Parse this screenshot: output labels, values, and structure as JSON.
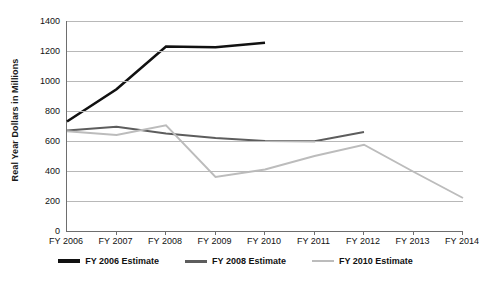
{
  "chart_data": {
    "type": "line",
    "title": "",
    "xlabel": "",
    "ylabel": "Real Year Dollars in Millions",
    "categories": [
      "FY 2006",
      "FY 2007",
      "FY 2008",
      "FY 2009",
      "FY 2010",
      "FY 2011",
      "FY 2012",
      "FY 2013",
      "FY 2014"
    ],
    "ylim": [
      0,
      1400
    ],
    "ytick_values": [
      0,
      200,
      400,
      600,
      800,
      1000,
      1200,
      1400
    ],
    "ytick_labels": [
      "0",
      "200",
      "400",
      "600",
      "800",
      "1000",
      "1200",
      "1400"
    ],
    "grid": true,
    "legend_position": "bottom",
    "series": [
      {
        "name": "FY 2006 Estimate",
        "color": "#111111",
        "values": [
          730,
          945,
          1230,
          1225,
          1255,
          null,
          null,
          null,
          null
        ]
      },
      {
        "name": "FY 2008 Estimate",
        "color": "#5d5d5d",
        "values": [
          670,
          695,
          650,
          620,
          600,
          598,
          660,
          null,
          null
        ]
      },
      {
        "name": "FY 2010 Estimate",
        "color": "#bcbcbc",
        "values": [
          665,
          640,
          705,
          360,
          410,
          500,
          575,
          395,
          220
        ]
      }
    ]
  },
  "axis": {
    "y_label": "Real Year Dollars in Millions"
  },
  "legend": {
    "items": [
      {
        "label": "FY 2006 Estimate",
        "color": "#111111"
      },
      {
        "label": "FY 2008 Estimate",
        "color": "#5d5d5d"
      },
      {
        "label": "FY 2010 Estimate",
        "color": "#bcbcbc"
      }
    ]
  }
}
